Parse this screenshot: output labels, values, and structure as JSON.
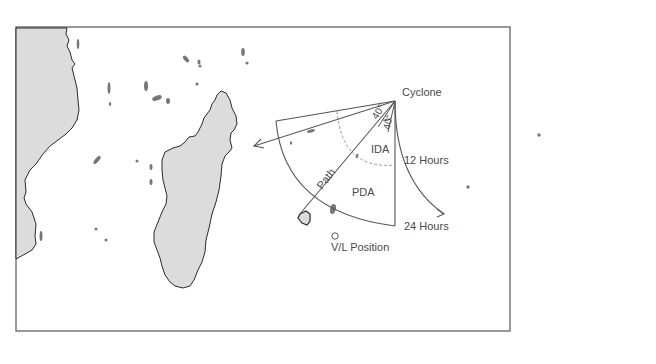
{
  "figure": {
    "labels": {
      "cyclone": "Cyclone",
      "ida": "IDA",
      "pda": "PDA",
      "path": "Path",
      "hours_12": "12 Hours",
      "hours_24": "24 Hours",
      "vl_position": "V/L Position",
      "angle_left": "40°",
      "angle_right": "40°"
    },
    "colors": {
      "land_fill": "#dcdcdc",
      "coast_stroke": "#2a2a2a",
      "line": "#555555",
      "dashed": "#9a9a9a",
      "island": "#777777",
      "frame": "#555555"
    }
  }
}
